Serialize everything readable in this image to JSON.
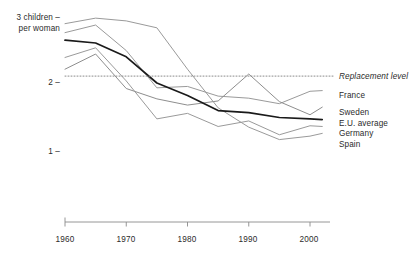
{
  "chart_data": {
    "type": "line",
    "title": "",
    "subtitle": "",
    "xlabel": "",
    "ylabel": "3 children per woman",
    "ylabel_line1": "3 children –",
    "ylabel_line2": "per woman",
    "xlim": [
      1960,
      2002
    ],
    "ylim": [
      0.85,
      3.05
    ],
    "xticks": [
      1960,
      1970,
      1980,
      1990,
      2000
    ],
    "xtick_labels": [
      "1960",
      "1970",
      "1980",
      "1990",
      "2000"
    ],
    "yticks": [
      1,
      2,
      3
    ],
    "ytick_labels": [
      "1",
      "2",
      "3 children – per woman"
    ],
    "grid": false,
    "legend_position": "right",
    "units": "children per woman",
    "reference_line": {
      "name": "Replacement level",
      "value": 2.1,
      "style": "dotted",
      "color": "#8a8a8a"
    },
    "x": [
      1960,
      1965,
      1970,
      1975,
      1980,
      1985,
      1990,
      1995,
      2000,
      2002
    ],
    "series": [
      {
        "name": "France",
        "color": "#9a9a9a",
        "width": 1.0,
        "values": [
          2.73,
          2.84,
          2.47,
          1.93,
          1.95,
          1.81,
          1.78,
          1.7,
          1.88,
          1.89
        ]
      },
      {
        "name": "Sweden",
        "color": "#8e8e8e",
        "width": 1.0,
        "values": [
          2.2,
          2.42,
          1.92,
          1.77,
          1.68,
          1.74,
          2.13,
          1.73,
          1.54,
          1.65
        ]
      },
      {
        "name": "E.U. average",
        "color": "#1a1a1a",
        "width": 1.7,
        "values": [
          2.62,
          2.58,
          2.38,
          2.0,
          1.82,
          1.6,
          1.57,
          1.5,
          1.48,
          1.47
        ]
      },
      {
        "name": "Germany",
        "color": "#9a9a9a",
        "width": 1.0,
        "values": [
          2.37,
          2.51,
          2.03,
          1.48,
          1.56,
          1.37,
          1.45,
          1.25,
          1.38,
          1.37
        ]
      },
      {
        "name": "Spain",
        "color": "#9a9a9a",
        "width": 1.0,
        "values": [
          2.86,
          2.94,
          2.9,
          2.8,
          2.2,
          1.64,
          1.36,
          1.18,
          1.23,
          1.27
        ]
      }
    ]
  },
  "legend": {
    "entries": [
      {
        "label": "Replacement level",
        "y": 77,
        "italic": true
      },
      {
        "label": "France",
        "y": 96,
        "italic": false
      },
      {
        "label": "Sweden",
        "y": 113,
        "italic": false
      },
      {
        "label": "E.U. average",
        "y": 124,
        "italic": false
      },
      {
        "label": "Germany",
        "y": 133,
        "italic": false
      },
      {
        "label": "Spain",
        "y": 144,
        "italic": false
      }
    ]
  },
  "axes": {
    "y_top_label_line1": "3 children –",
    "y_top_label_line2": "per woman",
    "y_two": "2 –",
    "y_one": "1 –",
    "x_ticks": [
      "1960",
      "1970",
      "1980",
      "1990",
      "2000"
    ]
  },
  "colors": {
    "background": "#ffffff",
    "text": "#2b2b2b",
    "axis": "#8a8a8a",
    "highlight_series": "#1a1a1a",
    "other_series": "#9a9a9a",
    "reference_line": "#8a8a8a"
  }
}
